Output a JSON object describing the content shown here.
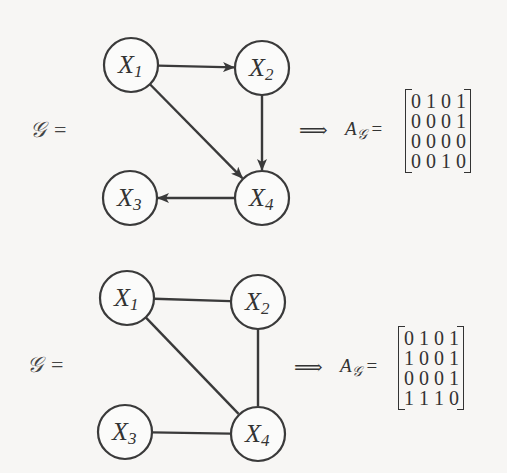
{
  "diagrams": [
    {
      "type": "directed",
      "graph_label": "𝒢",
      "equals": "=",
      "implies": "⟹",
      "matrix_name": "A",
      "matrix_sub": "𝒢",
      "nodes": [
        {
          "id": "X1",
          "letter": "X",
          "sub": "1",
          "cx": 131,
          "cy": 65
        },
        {
          "id": "X2",
          "letter": "X",
          "sub": "2",
          "cx": 262,
          "cy": 68
        },
        {
          "id": "X3",
          "letter": "X",
          "sub": "3",
          "cx": 130,
          "cy": 198
        },
        {
          "id": "X4",
          "letter": "X",
          "sub": "4",
          "cx": 262,
          "cy": 198
        }
      ],
      "edges": [
        {
          "from": "X1",
          "to": "X2"
        },
        {
          "from": "X1",
          "to": "X4"
        },
        {
          "from": "X2",
          "to": "X4"
        },
        {
          "from": "X4",
          "to": "X3"
        }
      ],
      "matrix": [
        [
          "0",
          "1",
          "0",
          "1"
        ],
        [
          "0",
          "0",
          "0",
          "1"
        ],
        [
          "0",
          "0",
          "0",
          "0"
        ],
        [
          "0",
          "0",
          "1",
          "0"
        ]
      ]
    },
    {
      "type": "undirected",
      "graph_label": "𝒢",
      "equals": "=",
      "implies": "⟹",
      "matrix_name": "A",
      "matrix_sub": "𝒢",
      "nodes": [
        {
          "id": "X1",
          "letter": "X",
          "sub": "1",
          "cx": 127,
          "cy": 298
        },
        {
          "id": "X2",
          "letter": "X",
          "sub": "2",
          "cx": 258,
          "cy": 302
        },
        {
          "id": "X3",
          "letter": "X",
          "sub": "3",
          "cx": 125,
          "cy": 432
        },
        {
          "id": "X4",
          "letter": "X",
          "sub": "4",
          "cx": 258,
          "cy": 434
        }
      ],
      "edges": [
        {
          "from": "X1",
          "to": "X2"
        },
        {
          "from": "X1",
          "to": "X4"
        },
        {
          "from": "X2",
          "to": "X4"
        },
        {
          "from": "X3",
          "to": "X4"
        }
      ],
      "matrix": [
        [
          "0",
          "1",
          "0",
          "1"
        ],
        [
          "1",
          "0",
          "0",
          "1"
        ],
        [
          "0",
          "0",
          "0",
          "1"
        ],
        [
          "1",
          "1",
          "1",
          "0"
        ]
      ]
    }
  ],
  "colors": {
    "stroke": "#3a3a3a",
    "node_fill": "#fbfbfa",
    "background": "#f7f6f4"
  }
}
